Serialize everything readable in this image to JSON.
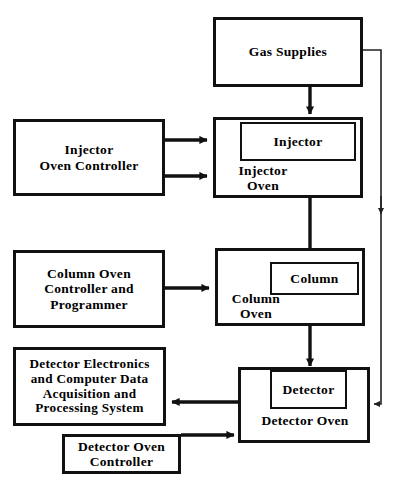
{
  "diagram": {
    "type": "block-flow",
    "canvas": {
      "width": 397,
      "height": 488
    },
    "colors": {
      "background": "#ffffff",
      "stroke": "#111111",
      "text": "#000000",
      "thin_stroke": "#222222"
    },
    "nodes": {
      "gas_supplies": {
        "label": "Gas  Supplies"
      },
      "injector_oven": {
        "label": "Injector\nOven"
      },
      "injector": {
        "label": "Injector"
      },
      "injector_oven_controller": {
        "label": "Injector\nOven  Controller"
      },
      "column_oven": {
        "label": "Column\nOven"
      },
      "column": {
        "label": "Column"
      },
      "column_oven_controller": {
        "label": "Column Oven\nController  and\nProgrammer"
      },
      "detector_oven": {
        "label": "Detector  Oven"
      },
      "detector": {
        "label": "Detector"
      },
      "detector_electronics": {
        "label": "Detector  Electronics\nand Computer Data\nAcquisition  and\nProcessing  System"
      },
      "detector_oven_controller": {
        "label": "Detector  Oven\nController"
      }
    },
    "edges": [
      {
        "name": "gas-supplies-to-injector-oven",
        "from": "gas_supplies",
        "to": "injector_oven",
        "style": "thick",
        "direction": "down"
      },
      {
        "name": "gas-supplies-to-detector-oven",
        "from": "gas_supplies",
        "to": "detector_oven",
        "style": "thin",
        "direction": "right-down-left"
      },
      {
        "name": "injector-controller-to-injector-oven-upper",
        "from": "injector_oven_controller",
        "to": "injector_oven",
        "style": "thick",
        "direction": "right"
      },
      {
        "name": "injector-controller-to-injector-oven-lower",
        "from": "injector_oven_controller",
        "to": "injector_oven",
        "style": "thick",
        "direction": "right"
      },
      {
        "name": "injector-to-column",
        "from": "injector",
        "to": "column",
        "style": "thick",
        "direction": "down"
      },
      {
        "name": "column-controller-to-column-oven",
        "from": "column_oven_controller",
        "to": "column_oven",
        "style": "thick",
        "direction": "right"
      },
      {
        "name": "column-to-detector",
        "from": "column",
        "to": "detector",
        "style": "thick",
        "direction": "down"
      },
      {
        "name": "detector-to-electronics",
        "from": "detector",
        "to": "detector_electronics",
        "style": "thick",
        "direction": "left"
      },
      {
        "name": "detector-oven-controller-to-detector-oven",
        "from": "detector_oven_controller",
        "to": "detector_oven",
        "style": "thick",
        "direction": "right"
      }
    ]
  }
}
